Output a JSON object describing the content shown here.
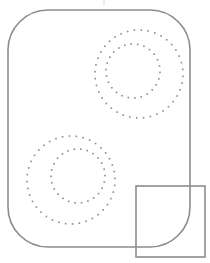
{
  "canvas": {
    "width": 210,
    "height": 263,
    "background": "#ffffff",
    "title": "geometric-line-figure"
  },
  "palette": {
    "outline": "#8c8c8c",
    "dot": "#8a8a92",
    "background": "#ffffff",
    "tick_mark": "#d8d8d8"
  },
  "chart_data": {
    "type": "scatter",
    "title": "",
    "xlabel": "",
    "ylabel": "",
    "xlim": [
      0,
      210
    ],
    "ylim": [
      0,
      263
    ],
    "grid": false,
    "legend": null,
    "series": [
      {
        "name": "upper-right-outer-ring",
        "marker": "square",
        "marker_size": 1.6,
        "color": "#8a8a92",
        "center": [
          139,
          74
        ],
        "radius": 44,
        "count": 40,
        "start_angle_deg": -96
      },
      {
        "name": "upper-right-inner-ring",
        "marker": "square",
        "marker_size": 1.6,
        "color": "#8a8a92",
        "center": [
          133,
          71
        ],
        "radius": 27,
        "count": 26,
        "start_angle_deg": -80
      },
      {
        "name": "lower-left-outer-ring",
        "marker": "square",
        "marker_size": 1.6,
        "color": "#8a8a92",
        "center": [
          71,
          180
        ],
        "radius": 44,
        "count": 40,
        "start_angle_deg": -92
      },
      {
        "name": "lower-left-inner-ring",
        "marker": "square",
        "marker_size": 1.6,
        "color": "#8a8a92",
        "center": [
          78,
          176
        ],
        "radius": 27,
        "count": 26,
        "start_angle_deg": -70
      }
    ],
    "shapes": [
      {
        "name": "rounded-rectangle",
        "type": "rounded-rect",
        "x": 8,
        "y": 10,
        "width": 182,
        "height": 237,
        "corner_radius": 40,
        "stroke": "#8c8c8c",
        "stroke_width": 1.6,
        "fill": "none"
      },
      {
        "name": "overlap-square",
        "type": "rect",
        "x": 136,
        "y": 186,
        "width": 69,
        "height": 71,
        "corner_radius": 0,
        "stroke": "#8c8c8c",
        "stroke_width": 1.6,
        "fill": "#ffffff"
      },
      {
        "name": "top-tick-mark",
        "type": "line",
        "x": 104,
        "y": 0,
        "width": 3,
        "height": 6,
        "stroke": "#d8d8d8",
        "stroke_width": 1,
        "fill": "none"
      }
    ]
  }
}
